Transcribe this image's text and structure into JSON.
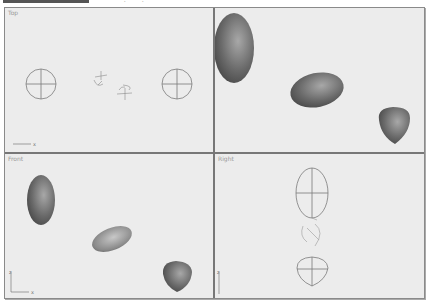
{
  "toolbar": {
    "glyph_1": "∙",
    "glyph_2": "∙"
  },
  "viewports": [
    {
      "id": "top",
      "label": "Top",
      "mode": "wireframe",
      "axis": [
        "x"
      ]
    },
    {
      "id": "perspective",
      "label": "",
      "mode": "shaded"
    },
    {
      "id": "front",
      "label": "Front",
      "mode": "shaded",
      "axis": [
        "z",
        "x"
      ]
    },
    {
      "id": "right",
      "label": "Right",
      "mode": "wireframe",
      "axis": [
        "z"
      ]
    }
  ],
  "colors": {
    "viewport_bg": "#ececec",
    "divider": "#777777",
    "wire": "#7a7a7a",
    "shaded_dark": "#4a4a4a",
    "shaded_light": "#a8a8a8"
  }
}
